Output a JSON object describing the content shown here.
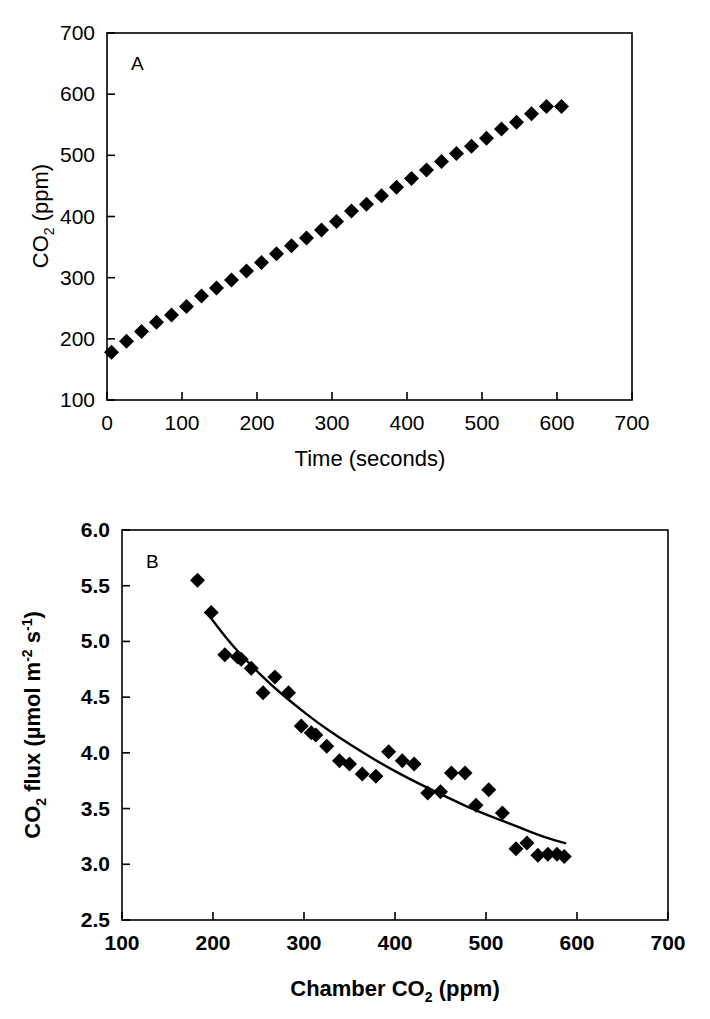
{
  "figure": {
    "background": "#ffffff",
    "ink": "#000000",
    "panels": [
      "A",
      "B"
    ]
  },
  "chart_data": [
    {
      "type": "scatter",
      "panel_label": "A",
      "title": "",
      "xlabel": "Time (seconds)",
      "ylabel": "CO2 (ppm)",
      "ylabel_parts": {
        "base": "CO",
        "sub": "2",
        "rest": " (ppm)"
      },
      "xlim": [
        0,
        700
      ],
      "ylim": [
        100,
        700
      ],
      "xticks": [
        0,
        100,
        200,
        300,
        400,
        500,
        600,
        700
      ],
      "yticks": [
        100,
        200,
        300,
        400,
        500,
        600,
        700
      ],
      "grid": false,
      "legend": "none",
      "marker": "filled-diamond",
      "marker_color": "#000000",
      "x": [
        6,
        26,
        46,
        66,
        86,
        106,
        126,
        146,
        166,
        186,
        206,
        226,
        246,
        266,
        286,
        306,
        326,
        346,
        366,
        386,
        406,
        426,
        446,
        466,
        486,
        506,
        526,
        546,
        566,
        586,
        606
      ],
      "y": [
        178,
        196,
        212,
        227,
        239,
        253,
        270,
        283,
        296,
        311,
        325,
        339,
        352,
        365,
        378,
        392,
        409,
        420,
        434,
        448,
        462,
        476,
        490,
        503,
        515,
        528,
        543,
        554,
        568,
        580,
        580
      ],
      "n_points": 31
    },
    {
      "type": "scatter",
      "panel_label": "B",
      "title": "",
      "xlabel": "Chamber CO2 (ppm)",
      "xlabel_parts": {
        "base": "Chamber CO",
        "sub": "2",
        "rest": " (ppm)"
      },
      "ylabel": "CO2 flux (umol m-2 s-1)",
      "ylabel_parts": {
        "base": "CO",
        "sub": "2",
        "mid": " flux (µmol m",
        "sup1": "-2",
        "mid2": " s",
        "sup2": "-1",
        "rest": ")"
      },
      "xlim": [
        100,
        700
      ],
      "ylim": [
        2.5,
        6.0
      ],
      "xticks": [
        100,
        200,
        300,
        400,
        500,
        600,
        700
      ],
      "yticks": [
        2.5,
        3.0,
        3.5,
        4.0,
        4.5,
        5.0,
        5.5,
        6.0
      ],
      "grid": false,
      "legend": "none",
      "marker": "filled-diamond",
      "marker_color": "#000000",
      "x": [
        183,
        198,
        213,
        227,
        231,
        242,
        255,
        268,
        283,
        297,
        308,
        313,
        325,
        339,
        350,
        364,
        379,
        393,
        408,
        421,
        436,
        450,
        462,
        477,
        489,
        503,
        518,
        533,
        545,
        557,
        568,
        578,
        586
      ],
      "y": [
        5.55,
        5.26,
        4.88,
        4.86,
        4.84,
        4.76,
        4.54,
        4.68,
        4.54,
        4.24,
        4.18,
        4.16,
        4.06,
        3.93,
        3.9,
        3.81,
        3.79,
        4.01,
        3.93,
        3.9,
        3.64,
        3.65,
        3.82,
        3.82,
        3.53,
        3.67,
        3.46,
        3.14,
        3.19,
        3.08,
        3.09,
        3.09,
        3.07
      ],
      "n_points": 33,
      "fit_curve": {
        "label": "fitted decline curve",
        "x_start": 195,
        "x_end": 587,
        "points_x": [
          195,
          215,
          240,
          265,
          290,
          315,
          340,
          365,
          390,
          415,
          440,
          465,
          490,
          515,
          540,
          565,
          587
        ],
        "points_y": [
          5.24,
          5.02,
          4.8,
          4.6,
          4.43,
          4.27,
          4.13,
          4.0,
          3.88,
          3.77,
          3.67,
          3.57,
          3.48,
          3.4,
          3.32,
          3.24,
          3.19
        ]
      }
    }
  ]
}
